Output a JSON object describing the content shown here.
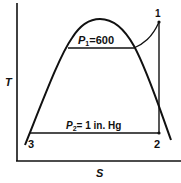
{
  "diagram": {
    "type": "T-S diagram (Rankine cycle)",
    "axes": {
      "y_label": "T",
      "x_label": "S"
    },
    "points": {
      "p1": "1",
      "p2": "2",
      "p3": "3"
    },
    "pressure_lines": {
      "high": {
        "symbol": "P",
        "subscript": "1",
        "value": "=600"
      },
      "low": {
        "symbol": "P",
        "subscript": "2",
        "value": "= 1 in. Hg"
      }
    },
    "colors": {
      "line": "#111111",
      "background": "#ffffff"
    }
  }
}
